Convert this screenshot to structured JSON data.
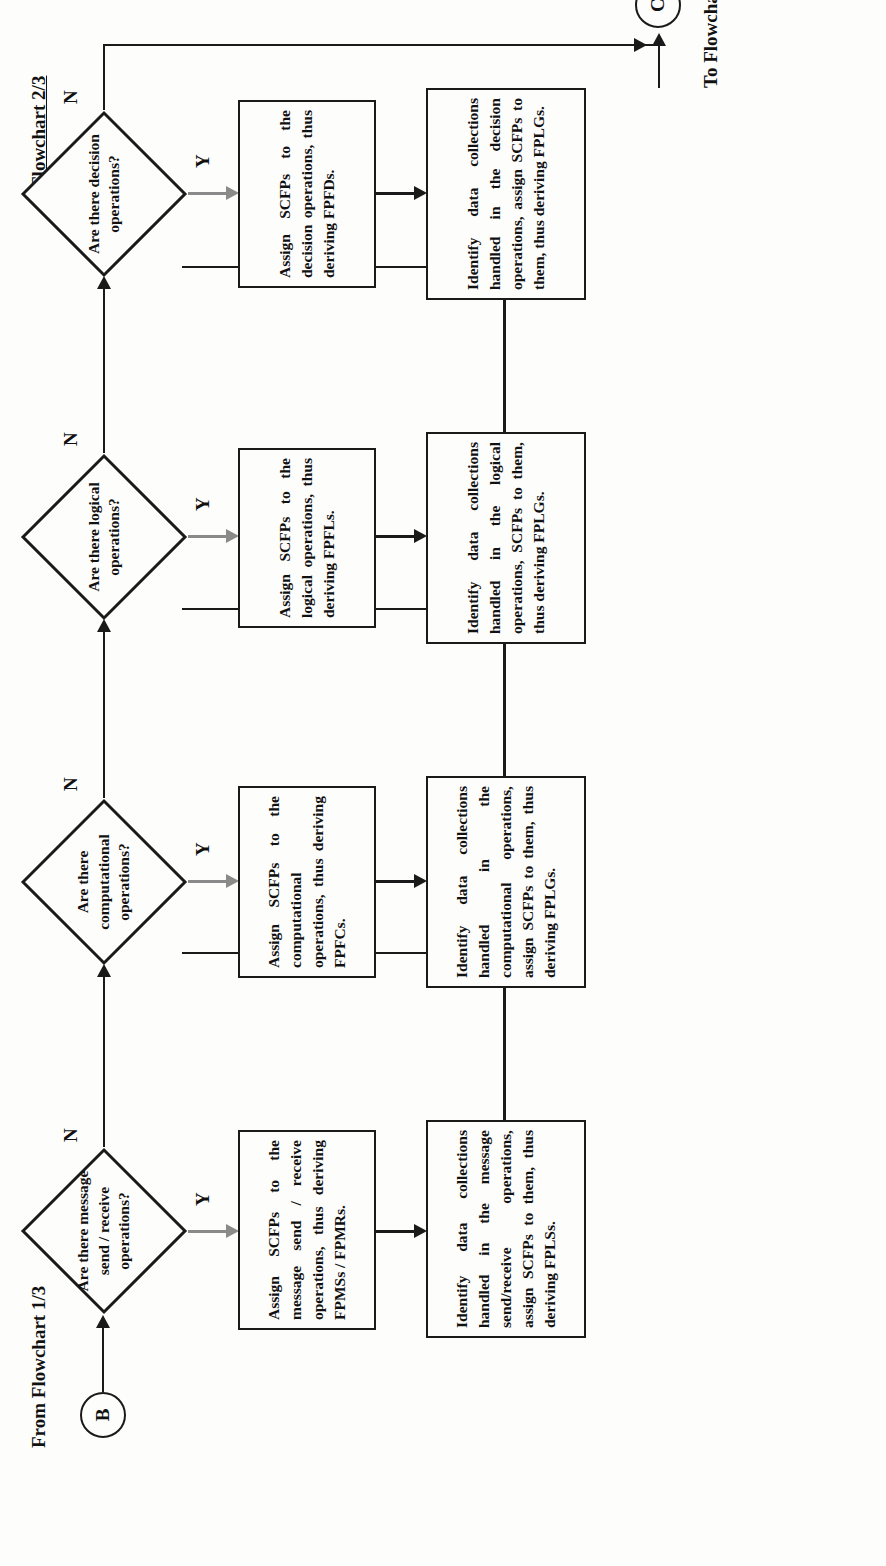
{
  "diagram": {
    "title": "Flowchart 2/3",
    "entry_label": "From Flowchart 1/3",
    "entry_connector": "B",
    "exit_label": "To Flowchart 3/3",
    "exit_connector": "C",
    "yes_label": "Y",
    "no_label": "N",
    "ink_color": "#1a1a1a",
    "gray_color": "#8a8a8a",
    "paper_color": "#fdfdfc"
  },
  "branches": [
    {
      "id": "message",
      "decision": "Are there message send / receive operations?",
      "assign": "Assign SCFPs to the message send / receive operations, thus deriving FPMSs / FPMRs.",
      "identify": "Identify data collections handled in the message send/receive operations, assign SCFPs to them, thus deriving FPLSs."
    },
    {
      "id": "computational",
      "decision": "Are there computational operations?",
      "assign": "Assign SCFPs to the computational operations, thus deriving FPFCs.",
      "identify": "Identify data collections handled in the computational operations, assign SCFPs to them, thus deriving FPLGs."
    },
    {
      "id": "logical",
      "decision": "Are there logical operations?",
      "assign": "Assign SCFPs to the logical operations, thus deriving FPFLs.",
      "identify": "Identify data collections handled in the logical operations, SCFPs to them, thus deriving FPLGs."
    },
    {
      "id": "decision",
      "decision": "Are there decision operations?",
      "assign": "Assign SCFPs to the decision operations, thus deriving FPFDs.",
      "identify": "Identify data collections handled in the decision operations, assign SCFPs to them, thus deriving FPLGs."
    }
  ]
}
